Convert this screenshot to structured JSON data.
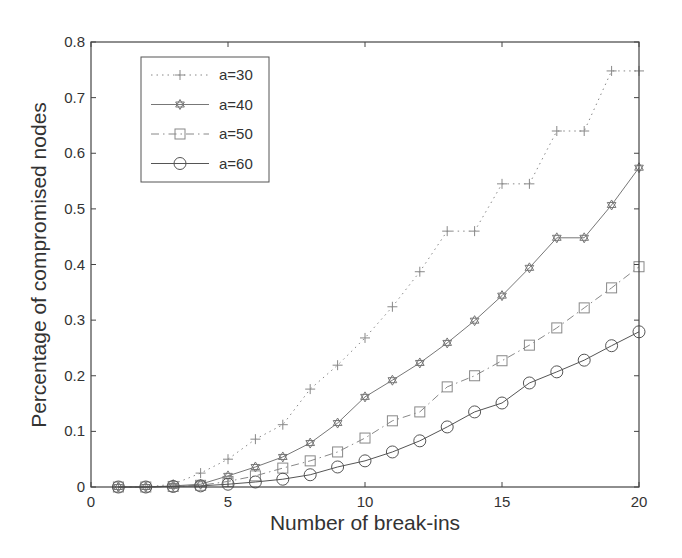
{
  "chart_data": {
    "type": "line",
    "title": "",
    "xlabel": "Number of break-ins",
    "ylabel": "Percentage of compromised nodes",
    "xlim": [
      0,
      20
    ],
    "ylim": [
      0,
      0.8
    ],
    "xticks": [
      0,
      5,
      10,
      15,
      20
    ],
    "yticks": [
      0,
      0.1,
      0.2,
      0.3,
      0.4,
      0.5,
      0.6,
      0.7,
      0.8
    ],
    "xtick_labels": [
      "0",
      "5",
      "10",
      "15",
      "20"
    ],
    "ytick_labels": [
      "0",
      "0.1",
      "0.2",
      "0.3",
      "0.4",
      "0.5",
      "0.6",
      "0.7",
      "0.8"
    ],
    "grid": false,
    "legend_position": "upper left",
    "x": [
      1,
      2,
      3,
      4,
      5,
      6,
      7,
      8,
      9,
      10,
      11,
      12,
      13,
      14,
      15,
      16,
      17,
      18,
      19,
      20
    ],
    "series": [
      {
        "name": "a=30",
        "marker": "plus",
        "line": "dotted",
        "color": "#888888",
        "values": [
          0,
          0,
          0.005,
          0.025,
          0.05,
          0.086,
          0.112,
          0.176,
          0.219,
          0.268,
          0.324,
          0.387,
          0.46,
          0.46,
          0.545,
          0.545,
          0.64,
          0.64,
          0.748,
          0.748
        ]
      },
      {
        "name": "a=40",
        "marker": "hexagram",
        "line": "solid",
        "color": "#777777",
        "values": [
          0,
          0,
          0.002,
          0.005,
          0.02,
          0.036,
          0.054,
          0.079,
          0.115,
          0.162,
          0.192,
          0.223,
          0.259,
          0.299,
          0.344,
          0.394,
          0.448,
          0.448,
          0.507,
          0.574
        ]
      },
      {
        "name": "a=50",
        "marker": "square",
        "line": "dashdot",
        "color": "#888888",
        "values": [
          0,
          0,
          0.001,
          0.003,
          0.01,
          0.02,
          0.034,
          0.047,
          0.063,
          0.088,
          0.119,
          0.135,
          0.18,
          0.2,
          0.227,
          0.255,
          0.286,
          0.322,
          0.358,
          0.396
        ]
      },
      {
        "name": "a=60",
        "marker": "circle",
        "line": "solid",
        "color": "#555555",
        "values": [
          0,
          0,
          0.001,
          0.002,
          0.005,
          0.009,
          0.014,
          0.022,
          0.036,
          0.047,
          0.063,
          0.083,
          0.108,
          0.135,
          0.151,
          0.187,
          0.207,
          0.228,
          0.254,
          0.279
        ]
      }
    ]
  }
}
